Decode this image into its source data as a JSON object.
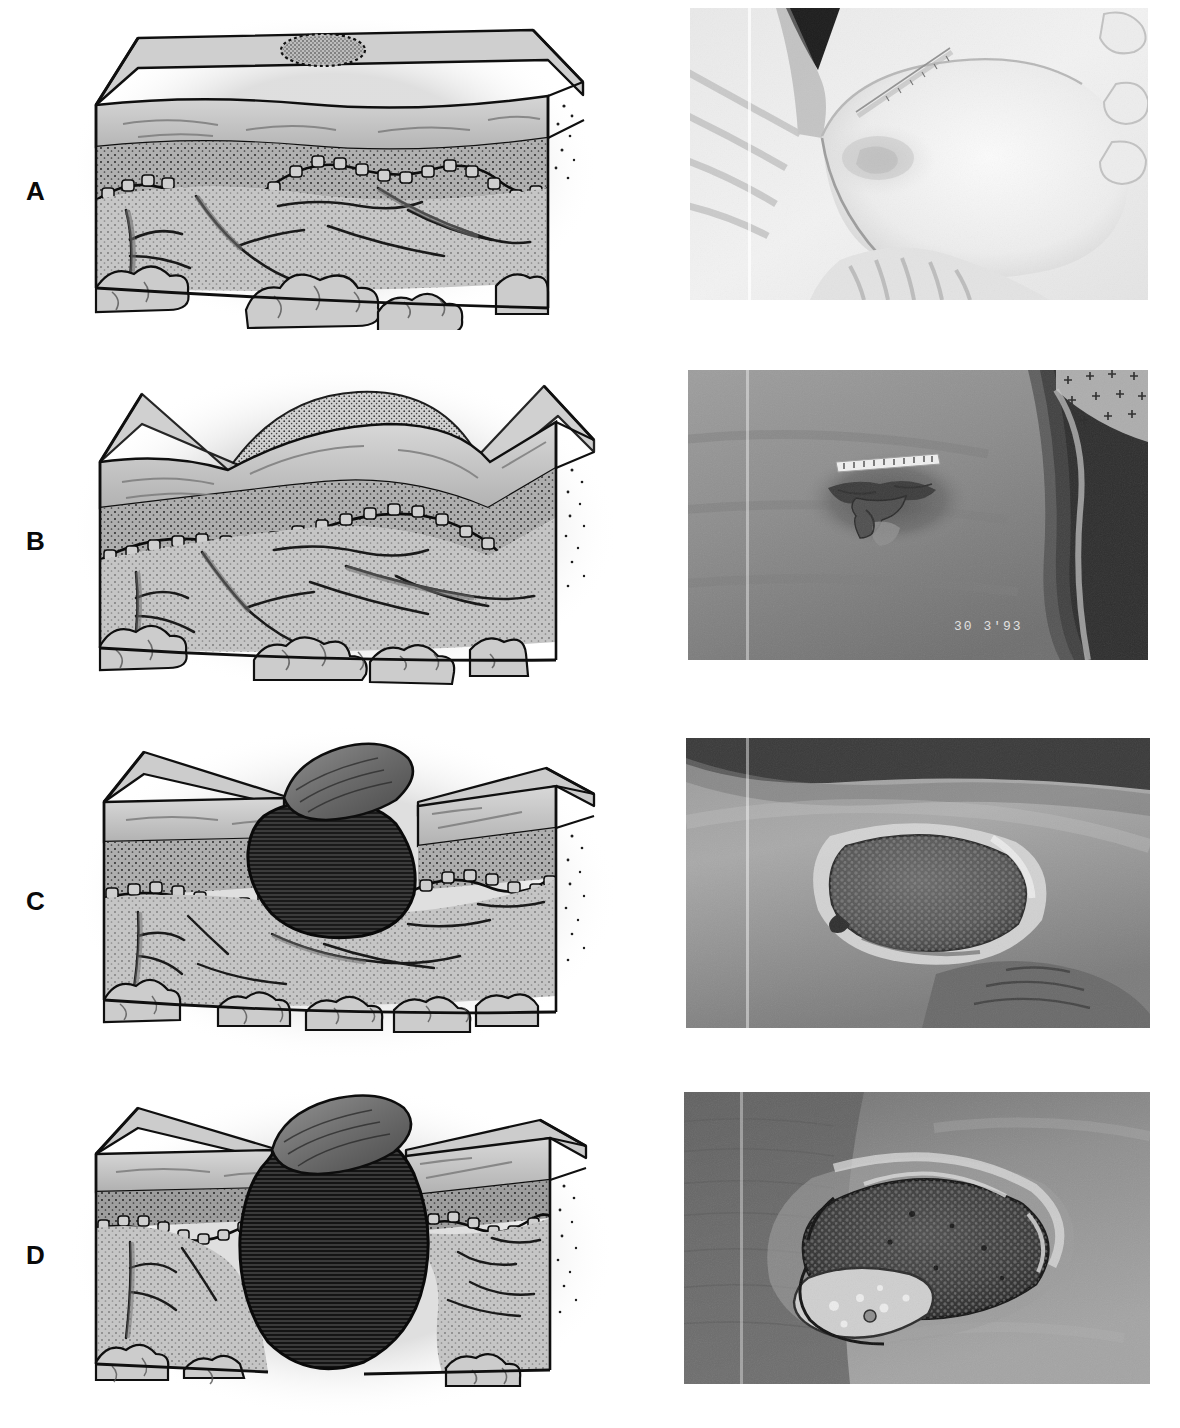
{
  "figure": {
    "panel_count": 4,
    "layout": "2 columns x 4 rows; left column schematic skin cross-section, right column clinical photograph",
    "background_color": "#ffffff",
    "ink_color": "#0a0a0a"
  },
  "panels": [
    {
      "letter": "A",
      "illustration": {
        "name": "stage-1-cross-section",
        "description": "Intact skin block with a stippled oval marked on the epidermal surface indicating non-blanchable erythema; all layers intact.",
        "layers": [
          "epidermis",
          "dermis",
          "dermal-epidermal junction",
          "subcutaneous tissue",
          "fat lobules"
        ],
        "surface_marker": "stippled oval lesion on intact epidermis",
        "depth_of_loss": "none — intact skin"
      },
      "photograph": {
        "name": "stage-1-clinical-photo",
        "description": "Buttock and sacral region of a patient lying on white linens; a pale reddened area outlined on the skin with a small adhesive measuring tape placed above it.",
        "tone": "very light / overexposed",
        "visible_markings": "thin measuring scale strip",
        "date_stamp": ""
      }
    },
    {
      "letter": "B",
      "illustration": {
        "name": "stage-2-cross-section",
        "description": "Skin block with the epidermis lifted into a shallow dome (blister); partial-thickness loss involving epidermis and upper dermis.",
        "layers": [
          "epidermis",
          "dermis",
          "dermal-epidermal junction",
          "subcutaneous tissue",
          "fat lobules"
        ],
        "surface_marker": "raised blister / abraded epidermis with stippled roof",
        "depth_of_loss": "partial thickness — epidermis and/or dermis"
      },
      "photograph": {
        "name": "stage-2-clinical-photo",
        "description": "Darker-toned skin over the sacrum showing a shallow irregular open lesion with a ruptured blister; a small printed adhesive measuring label lies above the wound and meshwork fabric appears at the upper right.",
        "tone": "mid-dark grayscale",
        "visible_markings": "adhesive measuring label, mesh fabric at upper right",
        "date_stamp": "30  3'93"
      }
    },
    {
      "letter": "C",
      "illustration": {
        "name": "stage-3-cross-section",
        "description": "Skin block with a flap of skin peeled back revealing a full-thickness crater extending through the dermis into subcutaneous tissue but not through underlying fascia.",
        "layers": [
          "epidermis",
          "dermis",
          "dermal-epidermal junction",
          "subcutaneous tissue",
          "fat lobules"
        ],
        "surface_marker": "peeled skin flap over dark hatched crater",
        "depth_of_loss": "full thickness — into subcutaneous tissue"
      },
      "photograph": {
        "name": "stage-3-clinical-photo",
        "description": "Close view of a full-thickness ulcer with a dark granular wound bed and a pale moist rim of macerated skin at the wound margins.",
        "tone": "mid grayscale",
        "visible_markings": "",
        "date_stamp": ""
      }
    },
    {
      "letter": "D",
      "illustration": {
        "name": "stage-4-cross-section",
        "description": "Skin block with a skin flap peeled back over a deep bulbous crater that extends through the full thickness of the subcutaneous tissue to underlying muscle and bone, with undermining beneath the wound edges.",
        "layers": [
          "epidermis",
          "dermis",
          "dermal-epidermal junction",
          "subcutaneous tissue",
          "fat lobules"
        ],
        "surface_marker": "peeled skin flap over very deep hatched crater with undermined edges",
        "depth_of_loss": "full thickness with extensive destruction to muscle, bone or supporting structures"
      },
      "photograph": {
        "name": "stage-4-clinical-photo",
        "description": "Deep irregular ulcer with a dark necrotic granular centre, a pale yellow slough area at the lower left and rolled, undermined wound edges surrounded by darker skin.",
        "tone": "dark grayscale",
        "visible_markings": "",
        "date_stamp": ""
      }
    }
  ],
  "artifacts": {
    "scan_line": "vertical light scan seam near the left edge of each photograph"
  }
}
